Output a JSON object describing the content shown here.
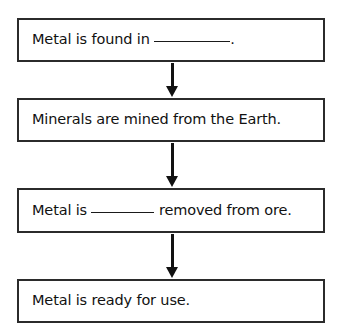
{
  "diagram": {
    "type": "flowchart",
    "orientation": "vertical",
    "title": "",
    "background_color": "#ffffff",
    "box_border_color": "#2b2b2b",
    "text_color": "#111111",
    "arrow_color": "#111111",
    "steps": [
      {
        "id": "step-1",
        "segments": [
          {
            "kind": "text",
            "value": "Metal is found in "
          },
          {
            "kind": "blank",
            "value": ""
          },
          {
            "kind": "text",
            "value": "."
          }
        ],
        "full_text": "Metal is found in __________."
      },
      {
        "id": "step-2",
        "segments": [
          {
            "kind": "text",
            "value": "Minerals are mined from the Earth."
          }
        ],
        "full_text": "Minerals are mined from the Earth."
      },
      {
        "id": "step-3",
        "segments": [
          {
            "kind": "text",
            "value": "Metal is "
          },
          {
            "kind": "blank",
            "value": ""
          },
          {
            "kind": "text",
            "value": " removed from ore."
          }
        ],
        "full_text": "Metal is ________ removed from ore."
      },
      {
        "id": "step-4",
        "segments": [
          {
            "kind": "text",
            "value": "Metal is ready for use."
          }
        ],
        "full_text": "Metal is ready for use."
      }
    ],
    "connectors": [
      {
        "id": "arrow-1",
        "from": "step-1",
        "to": "step-2",
        "glyph": "down-arrow"
      },
      {
        "id": "arrow-2",
        "from": "step-2",
        "to": "step-3",
        "glyph": "down-arrow"
      },
      {
        "id": "arrow-3",
        "from": "step-3",
        "to": "step-4",
        "glyph": "down-arrow"
      }
    ]
  }
}
